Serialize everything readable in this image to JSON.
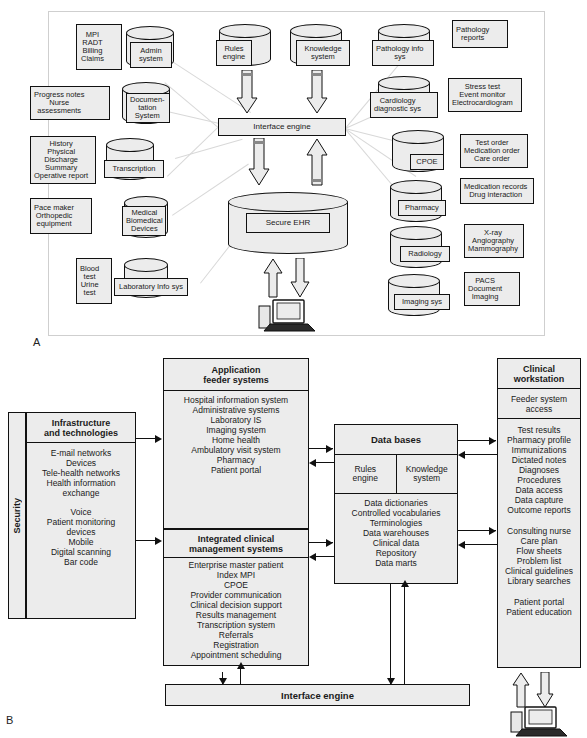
{
  "panels": {
    "a_label": "A",
    "b_label": "B"
  },
  "panelA": {
    "left_column": [
      {
        "note": "MPI\nRADT\nBilling\nClaims",
        "system": "Admin\nsystem"
      },
      {
        "note": "Progress notes\nNurse\nassessments",
        "system": "Documen-\ntation\nSystem"
      },
      {
        "note": "History\nPhysical\nDischarge\nSummary\nOperative report",
        "system": "Transcription"
      },
      {
        "note": "Pace maker\nOrthopedic\nequipment",
        "system": "Medical\nBiomedical\nDevices"
      },
      {
        "note": "Blood\ntest\nUrine\ntest",
        "system": "Laboratory Info sys"
      }
    ],
    "right_column": [
      {
        "system": "Pathology info\nsys",
        "note": "Pathology\nreports"
      },
      {
        "system": "Cardiology\ndiagnostic sys",
        "note": "Stress test\nEvent monitor\nElectrocardiogram"
      },
      {
        "system": "CPOE",
        "note": "Test order\nMedication order\nCare order"
      },
      {
        "system": "Pharmacy",
        "note": "Medication records\nDrug interaction"
      },
      {
        "system": "Radiology",
        "note": "X-ray\nAngiography\nMammography"
      },
      {
        "system": "Imaging sys",
        "note": "PACS\nDocument\nImaging"
      }
    ],
    "top_engines": [
      {
        "label": "Rules\nengine"
      },
      {
        "label": "Knowledge\nsystem"
      }
    ],
    "interface_engine": "Interface engine",
    "ehr": "Secure EHR"
  },
  "panelB": {
    "security_label": "Security",
    "infrastructure": {
      "title": "Infrastructure\nand technologies",
      "items_group1": "E-mail networks\nDevices\nTele-health networks\nHealth information\nexchange",
      "items_group2": "Voice\nPatient monitoring\ndevices\nMobile\nDigital scanning\nBar code"
    },
    "application_feeder": {
      "title": "Application\nfeeder systems",
      "items": "Hospital information system\nAdministrative systems\nLaboratory IS\nImaging system\nHome health\nAmbulatory visit system\nPharmacy\nPatient portal"
    },
    "integrated_clinical": {
      "title": "Integrated clinical\nmanagement systems",
      "items": "Enterprise master patient\nIndex MPI\nCPOE\nProvider communication\nClinical decision support\nResults management\nTranscription system\nReferrals\nRegistration\nAppointment scheduling"
    },
    "databases": {
      "title": "Data bases",
      "rules_engine": "Rules\nengine",
      "knowledge_system": "Knowledge\nsystem",
      "items": "Data dictionaries\nControlled vocabularies\nTerminologies\nData warehouses\nClinical data\nRepository\nData marts"
    },
    "clinical_workstation": {
      "title": "Clinical\nworkstation",
      "access": "Feeder system\naccess",
      "items_group1": "Test results\nPharmacy profile\nImmunizations\nDictated notes\nDiagnoses\nProcedures\nData access\nData capture\nOutcome reports",
      "items_group2": "Consulting nurse\nCare plan\nFlow sheets\nProblem list\nClinical guidelines\nLibrary searches",
      "items_group3": "Patient portal\nPatient education"
    },
    "interface_engine": "Interface engine"
  },
  "colors": {
    "box_fill": "#ececec",
    "stroke": "#111111",
    "link_line": "#d8d8d8",
    "panel_border": "#cfcfcf"
  }
}
